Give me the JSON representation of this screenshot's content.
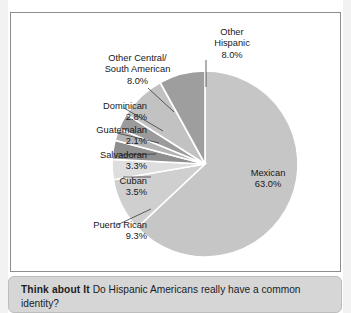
{
  "chart_data": {
    "type": "pie",
    "title": "",
    "legend_position": "callout-labels",
    "unit": "%",
    "categories": [
      "Mexican",
      "Puerto Rican",
      "Cuban",
      "Salvadoran",
      "Guatemalan",
      "Dominican",
      "Other Central/South American",
      "Other Hispanic"
    ],
    "values": [
      63.0,
      9.3,
      3.5,
      3.3,
      2.1,
      2.8,
      8.0,
      8.0
    ],
    "slices": [
      {
        "name": "Mexican",
        "value": 63.0,
        "value_label": "63.0%",
        "label": "Mexican",
        "color": "#c6c6c6",
        "label_placement": "inside"
      },
      {
        "name": "Puerto Rican",
        "value": 9.3,
        "value_label": "9.3%",
        "label": "Puerto Rican",
        "color": "#cfcfcf",
        "label_placement": "callout"
      },
      {
        "name": "Cuban",
        "value": 3.5,
        "value_label": "3.5%",
        "label": "Cuban",
        "color": "#dedede",
        "label_placement": "callout"
      },
      {
        "name": "Salvadoran",
        "value": 3.3,
        "value_label": "3.3%",
        "label": "Salvadoran",
        "color": "#8f8f8f",
        "label_placement": "callout"
      },
      {
        "name": "Guatemalan",
        "value": 2.1,
        "value_label": "2.1%",
        "label": "Guatemalan",
        "color": "#b3b3b3",
        "label_placement": "callout"
      },
      {
        "name": "Dominican",
        "value": 2.8,
        "value_label": "2.8%",
        "label": "Dominican",
        "color": "#9b9b9b",
        "label_placement": "callout"
      },
      {
        "name": "Other Central/South American",
        "value": 8.0,
        "value_label": "8.0%",
        "label": "Other Central/\nSouth American",
        "color": "#c2c2c2",
        "label_placement": "callout"
      },
      {
        "name": "Other Hispanic",
        "value": 8.0,
        "value_label": "8.0%",
        "label": "Other\nHispanic",
        "color": "#9e9e9e",
        "label_placement": "callout"
      }
    ]
  },
  "labels": {
    "other_hispanic": "Other\nHispanic\n8.0%",
    "other_central": "Other Central/\nSouth American\n8.0%",
    "dominican": "Dominican\n2.8%",
    "guatemalan": "Guatemalan\n2.1%",
    "salvadoran": "Salvadoran\n3.3%",
    "cuban": "Cuban\n3.5%",
    "puerto_rican": "Puerto Rican\n9.3%",
    "mexican": "Mexican\n63.0%"
  },
  "caption": {
    "lead": "Think about It",
    "body": "Do Hispanic Americans really have a common identity?"
  },
  "top_clipped_text": "",
  "colors": {
    "frame_border": "#8e8e8e",
    "caption_background": "#d6d6d6",
    "caption_border": "#bdbdbd",
    "text": "#16181a",
    "slice_divider": "#ffffff"
  }
}
